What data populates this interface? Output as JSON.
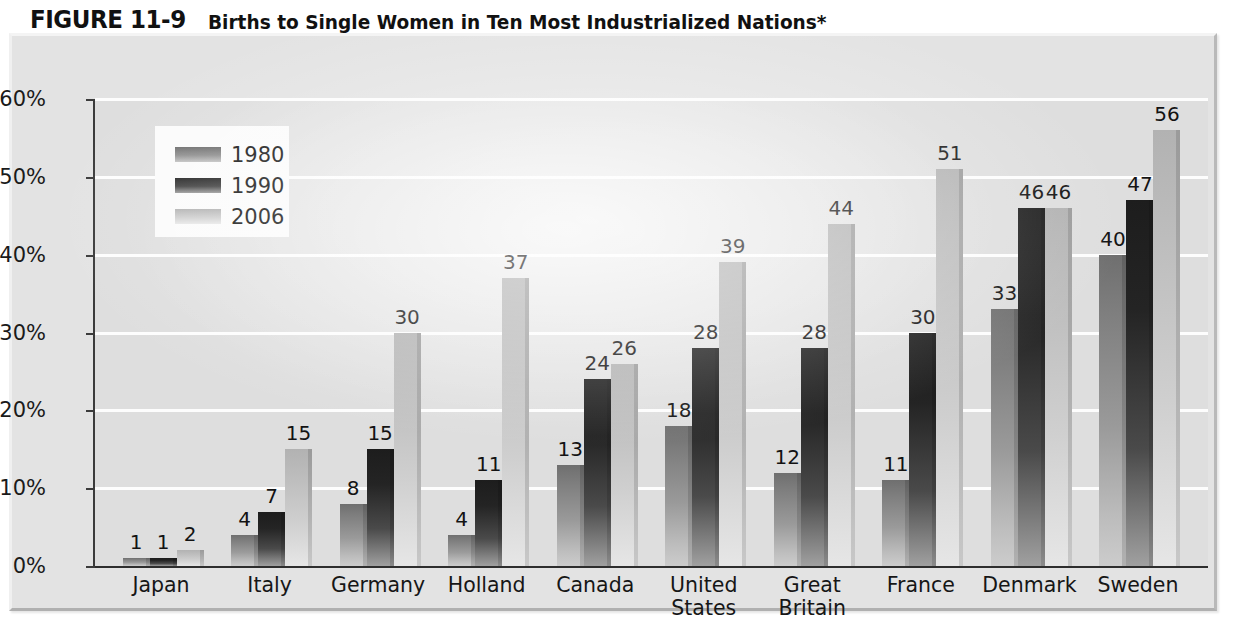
{
  "title": {
    "figure_number": "FIGURE 11-9",
    "caption": "Births to Single Women in Ten Most Industrialized Nations*"
  },
  "legend": {
    "position": "inside-top-left",
    "entries": [
      {
        "label": "1980",
        "swatch": "medium-gray"
      },
      {
        "label": "1990",
        "swatch": "dark-gray"
      },
      {
        "label": "2006",
        "swatch": "light-gray"
      }
    ]
  },
  "axis": {
    "y_ticks": [
      "0%",
      "10%",
      "20%",
      "30%",
      "40%",
      "50%",
      "60%"
    ],
    "y_min": 0,
    "y_max": 60
  },
  "chart_data": {
    "type": "bar",
    "title": "Births to Single Women in Ten Most Industrialized Nations*",
    "xlabel": "",
    "ylabel": "",
    "ylim": [
      0,
      60
    ],
    "ytick_labels": [
      "0%",
      "10%",
      "20%",
      "30%",
      "40%",
      "50%",
      "60%"
    ],
    "ytick_values": [
      0,
      10,
      20,
      30,
      40,
      50,
      60
    ],
    "grid": true,
    "grid_axis": "y",
    "legend_position": "upper left",
    "categories": [
      "Japan",
      "Italy",
      "Germany",
      "Holland",
      "Canada",
      "United\nStates",
      "Great\nBritain",
      "France",
      "Denmark",
      "Sweden"
    ],
    "series": [
      {
        "name": "1980",
        "values": [
          1,
          4,
          8,
          4,
          13,
          18,
          12,
          11,
          33,
          40
        ]
      },
      {
        "name": "1990",
        "values": [
          1,
          7,
          15,
          11,
          24,
          28,
          28,
          30,
          46,
          47
        ]
      },
      {
        "name": "2006",
        "values": [
          2,
          15,
          30,
          37,
          26,
          39,
          44,
          51,
          46,
          56
        ]
      }
    ],
    "data_labels": true
  },
  "colors": {
    "frame_background": "#e3e3e3",
    "plot_background": "#dedede",
    "gridline": "#fdfdfd",
    "axis": "#3b3b3b",
    "series_1980": "#8d8d8d",
    "series_1990": "#242424",
    "series_2006": "#cfcfcf",
    "text": "#131313"
  }
}
